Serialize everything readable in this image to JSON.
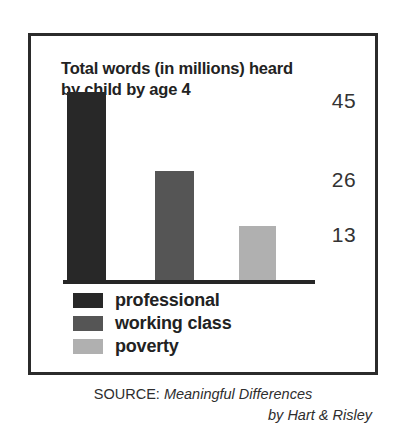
{
  "figure": {
    "title": "Total words (in millions) heard\nby child by age 4",
    "frame_color": "#2b2b2b",
    "background": "#ffffff"
  },
  "chart_data": {
    "type": "bar",
    "title": "Total words (in millions) heard by child by age 4",
    "xlabel": "",
    "ylabel": "",
    "categories": [
      "professional",
      "working class",
      "poverty"
    ],
    "values": [
      45,
      26,
      13
    ],
    "value_labels": [
      "45",
      "26",
      "13"
    ],
    "units": "millions of words",
    "ylim": [
      0,
      45
    ],
    "grid": false,
    "legend_position": "below-axis-left",
    "series": [
      {
        "name": "Total words heard by age 4 (millions)",
        "values": [
          45,
          26,
          13
        ],
        "colors": [
          "#282828",
          "#555555",
          "#b0b0b0"
        ]
      }
    ],
    "annotations": []
  },
  "legend": {
    "items": [
      {
        "label": "professional",
        "color": "#282828"
      },
      {
        "label": "working class",
        "color": "#555555"
      },
      {
        "label": "poverty",
        "color": "#b0b0b0"
      }
    ]
  },
  "source": {
    "label": "SOURCE:",
    "title": " Meaningful Differences",
    "author_line": "by Hart & Risley"
  }
}
